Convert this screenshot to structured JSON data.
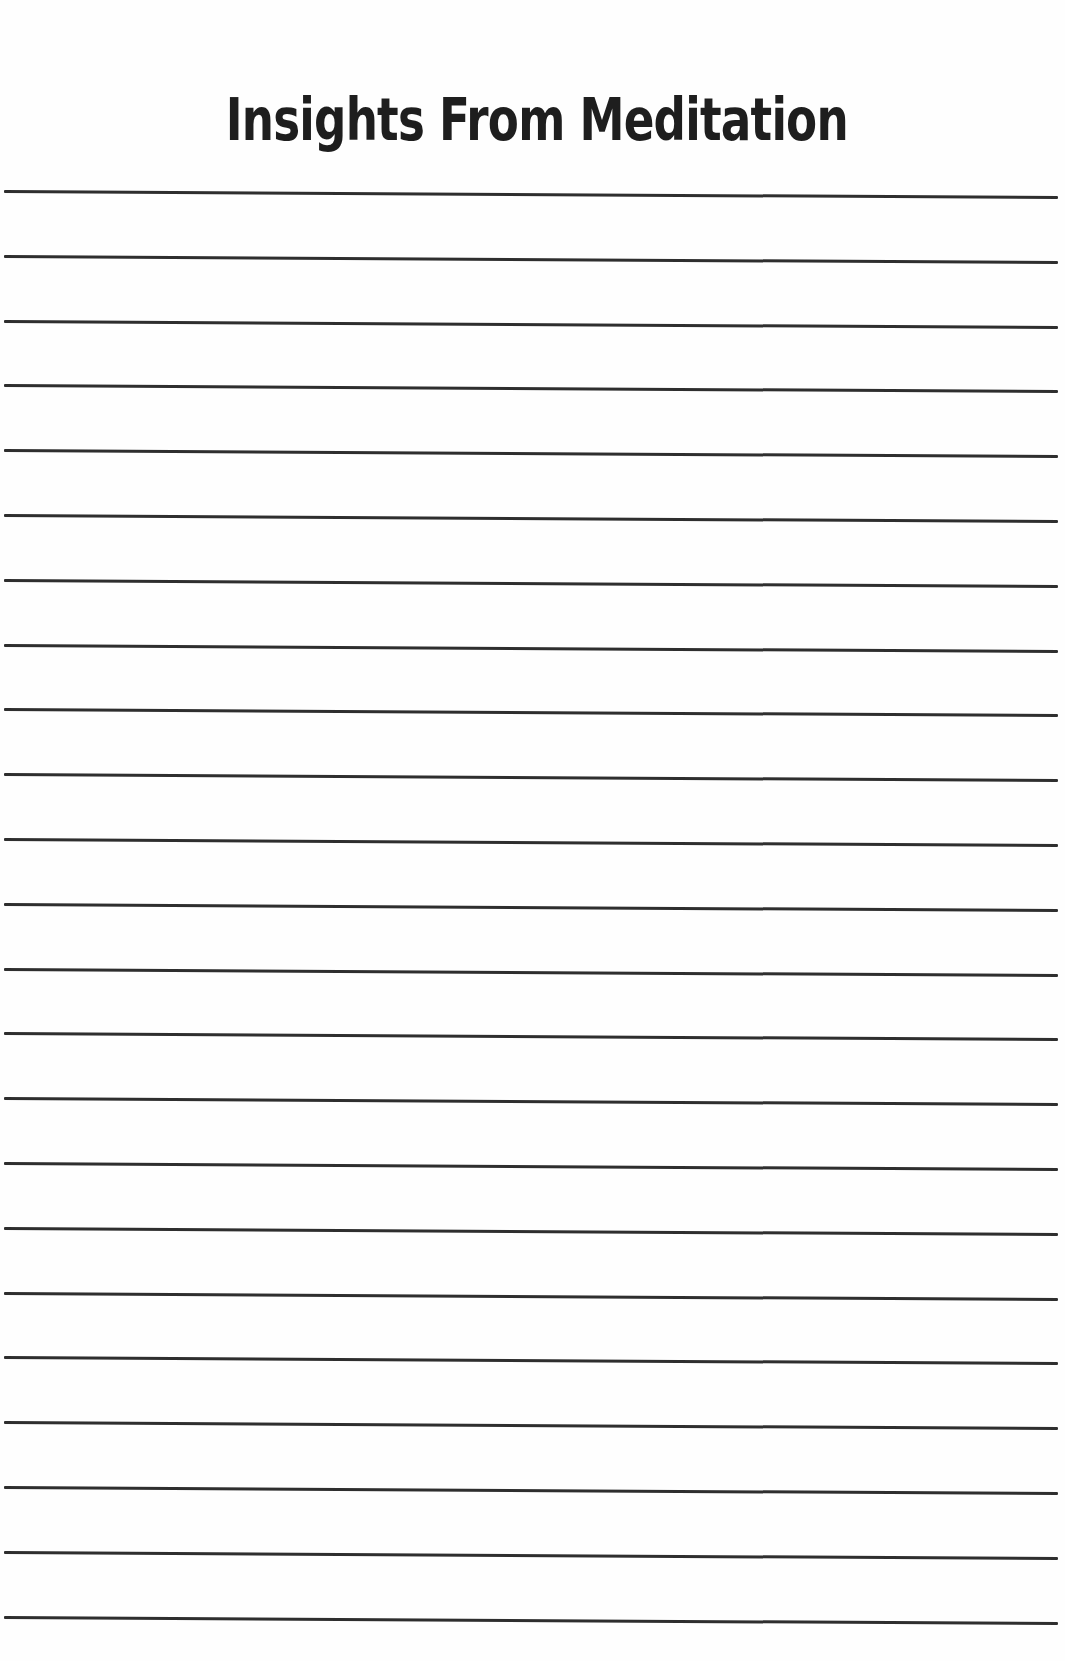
{
  "page": {
    "title": "Insights From Meditation",
    "line_count": 23,
    "first_line_y": 190,
    "line_spacing": 64.8,
    "line_color": "#2e2e2e",
    "background": "#fefefe"
  }
}
